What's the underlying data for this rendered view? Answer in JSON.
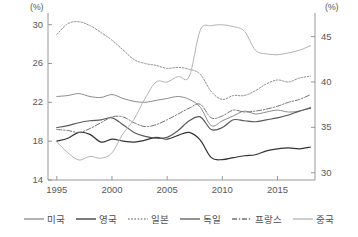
{
  "chart_data": {
    "type": "line",
    "title": "",
    "xlabel": "",
    "ylabel": "(%)",
    "ylabel_right": "(%)",
    "unit_left": "(%)",
    "unit_right": "(%)",
    "grid": false,
    "legend_position": "bottom",
    "x": [
      1995,
      1996,
      1997,
      1998,
      1999,
      2000,
      2001,
      2002,
      2003,
      2004,
      2005,
      2006,
      2007,
      2008,
      2009,
      2010,
      2011,
      2012,
      2013,
      2014,
      2015,
      2016,
      2017,
      2018
    ],
    "xlim": [
      1994.2,
      2018.4
    ],
    "xticks": [
      1995,
      2000,
      2005,
      2010,
      2015
    ],
    "xtick_labels": [
      "1995",
      "2000",
      "2005",
      "2010",
      "2015"
    ],
    "ylim_left": [
      14,
      31.2
    ],
    "yticks_left": [
      14,
      18,
      22,
      26,
      30
    ],
    "ytick_labels_left": [
      "14",
      "18",
      "22",
      "26",
      "30"
    ],
    "ylim_right": [
      29.2,
      47.6
    ],
    "yticks_right": [
      30,
      35,
      40,
      45
    ],
    "ytick_labels_right": [
      "30",
      "35",
      "40",
      "45"
    ],
    "series": [
      {
        "name": "미국",
        "axis": "left",
        "style": "solid",
        "color": "#8c8c8c",
        "width": 1.0,
        "values": [
          22.6,
          22.7,
          22.9,
          22.6,
          22.5,
          22.8,
          22.4,
          22.1,
          22.0,
          22.2,
          22.4,
          22.6,
          22.3,
          21.5,
          19.6,
          20.1,
          20.6,
          21.1,
          20.8,
          21.0,
          21.2,
          21.0,
          21.1,
          21.5
        ]
      },
      {
        "name": "영국",
        "axis": "left",
        "style": "solid",
        "color": "#333333",
        "width": 1.2,
        "values": [
          18.0,
          18.3,
          18.9,
          18.7,
          17.9,
          18.2,
          18.0,
          17.9,
          18.1,
          18.4,
          18.2,
          18.6,
          18.9,
          18.1,
          16.3,
          16.1,
          16.3,
          16.5,
          16.6,
          17.0,
          17.2,
          17.3,
          17.2,
          17.4
        ]
      },
      {
        "name": "일본",
        "axis": "left",
        "style": "dotted",
        "color": "#8c8c8c",
        "width": 1.0,
        "values": [
          29.0,
          30.1,
          30.3,
          29.9,
          29.2,
          28.4,
          27.4,
          26.4,
          26.0,
          25.8,
          25.5,
          25.6,
          25.4,
          24.9,
          23.1,
          22.3,
          22.7,
          22.7,
          23.2,
          23.9,
          24.3,
          24.1,
          24.5,
          24.7
        ]
      },
      {
        "name": "독일",
        "axis": "left",
        "style": "solid",
        "color": "#595959",
        "width": 1.2,
        "values": [
          19.4,
          19.6,
          19.9,
          20.1,
          20.2,
          20.4,
          19.7,
          18.9,
          18.5,
          18.3,
          18.4,
          19.1,
          20.1,
          20.5,
          19.2,
          19.4,
          20.2,
          20.1,
          20.0,
          20.2,
          20.4,
          20.7,
          21.1,
          21.4
        ]
      },
      {
        "name": "프랑스",
        "axis": "left",
        "style": "dashdot",
        "color": "#737373",
        "width": 1.0,
        "values": [
          19.2,
          19.1,
          18.9,
          19.3,
          19.9,
          20.5,
          20.5,
          19.9,
          19.5,
          19.7,
          20.2,
          20.8,
          21.4,
          21.8,
          20.4,
          20.6,
          21.2,
          21.0,
          21.1,
          21.3,
          21.6,
          22.0,
          22.3,
          22.8
        ]
      },
      {
        "name": "중국",
        "axis": "right",
        "style": "solid",
        "color": "#b3b3b3",
        "width": 1.0,
        "values": [
          33.4,
          32.2,
          31.4,
          31.8,
          31.6,
          32.2,
          34.3,
          35.9,
          38.2,
          40.0,
          40.0,
          40.6,
          40.6,
          45.7,
          46.2,
          46.3,
          46.1,
          45.6,
          43.5,
          43.1,
          43.0,
          43.2,
          43.5,
          44.0
        ]
      }
    ]
  },
  "legend": {
    "items": [
      {
        "label": "미국",
        "style": "solid",
        "color": "#8c8c8c"
      },
      {
        "label": "영국",
        "style": "solid",
        "color": "#333333"
      },
      {
        "label": "일본",
        "style": "dotted",
        "color": "#8c8c8c"
      },
      {
        "label": "독일",
        "style": "solid",
        "color": "#595959"
      },
      {
        "label": "프랑스",
        "style": "dashdot",
        "color": "#737373"
      },
      {
        "label": "중국",
        "style": "solid",
        "color": "#b3b3b3"
      }
    ]
  }
}
